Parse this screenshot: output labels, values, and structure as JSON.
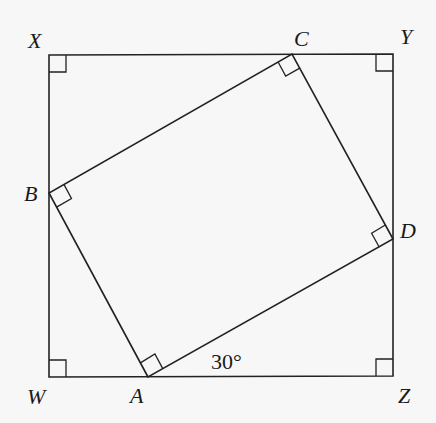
{
  "diagram": {
    "outer_square": {
      "vertices": {
        "X": [
          49,
          55
        ],
        "Y": [
          393,
          54
        ],
        "Z": [
          393,
          376
        ],
        "W": [
          49,
          377
        ]
      }
    },
    "inner_rectangle": {
      "vertices": {
        "A": [
          148,
          377
        ],
        "B": [
          49,
          193
        ],
        "C": [
          292,
          54
        ],
        "D": [
          393,
          239
        ]
      }
    },
    "labels": {
      "X": "X",
      "Y": "Y",
      "Z": "Z",
      "W": "W",
      "A": "A",
      "B": "B",
      "C": "C",
      "D": "D"
    },
    "angle_label": "30°",
    "right_angle_marks": [
      "X",
      "Y",
      "Z",
      "W",
      "A",
      "B",
      "C",
      "D"
    ],
    "colors": {
      "stroke": "#222222",
      "background": "#f7f7f7"
    }
  }
}
